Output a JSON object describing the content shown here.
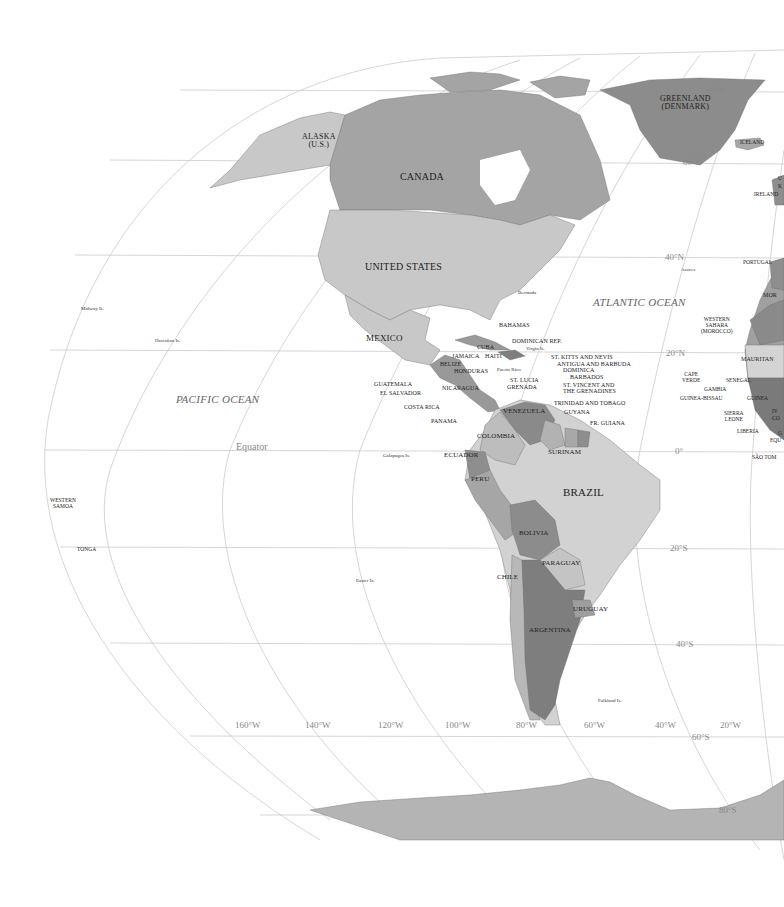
{
  "map": {
    "colors": {
      "background": "#ffffff",
      "graticule": "#bdbdbd",
      "land_light": "#d6d6d6",
      "land_mid": "#b8b8b8",
      "land_dark": "#8f8f8f",
      "land_darker": "#7a7a7a",
      "label": "#222222",
      "grid_label": "#888888"
    },
    "oceans": {
      "pacific": "PACIFIC OCEAN",
      "atlantic": "ATLANTIC OCEAN"
    },
    "latitude_labels": {
      "n80": "80°N",
      "n60": "60°N",
      "n40": "40°N",
      "n20": "20°N",
      "equator_left": "Equator",
      "equator_right": "0°",
      "s20": "20°S",
      "s40": "40°S",
      "s60": "60°S",
      "s80": "80°S"
    },
    "longitude_labels": [
      "160°W",
      "140°W",
      "120°W",
      "100°W",
      "80°W",
      "60°W",
      "40°W",
      "20°W"
    ],
    "countries": {
      "greenland": "GREENLAND",
      "greenland_sub": "(DENMARK)",
      "alaska": "ALASKA",
      "alaska_sub": "(U.S.)",
      "canada": "CANADA",
      "united_states": "UNITED STATES",
      "mexico": "MEXICO",
      "iceland": "ICELAND",
      "ireland": "IRELAND",
      "uk_partial_1": "U",
      "uk_partial_2": "K",
      "portugal": "PORTUGAL",
      "morocco_partial": "MOR",
      "western_sahara_1": "WESTERN",
      "western_sahara_2": "SAHARA",
      "western_sahara_3": "(MOROCCO)",
      "mauritania_partial": "MAURITAN",
      "cape_verde_1": "CAPE",
      "cape_verde_2": "VERDE",
      "senegal": "SENEGAL",
      "gambia": "GAMBIA",
      "guinea_bissau": "GUINEA-BISSAU",
      "guinea": "GUINEA",
      "sierra_leone_1": "SIERRA",
      "sierra_leone_2": "LEONE",
      "liberia": "LIBERIA",
      "ivory_partial_1": "IV",
      "ivory_partial_2": "CO",
      "eq_partial_1": "G",
      "eq_partial_2": "EQU",
      "sao_tome": "SÃO TOM",
      "bahamas": "BAHAMAS",
      "cuba": "CUBA",
      "jamaica": "JAMAICA",
      "haiti": "HAITI",
      "dominican_rep": "DOMINICAN REP.",
      "belize": "BELIZE",
      "honduras": "HONDURAS",
      "guatemala": "GUATEMALA",
      "el_salvador": "EL SALVADOR",
      "nicaragua": "NICARAGUA",
      "costa_rica": "COSTA RICA",
      "panama": "PANAMA",
      "st_kitts": "ST. KITTS AND NEVIS",
      "antigua": "ANTIGUA AND BARBUDA",
      "dominica": "DOMINICA",
      "barbados": "BARBADOS",
      "st_lucia": "ST. LUCIA",
      "grenada": "GRENADA",
      "st_vincent_1": "ST. VINCENT AND",
      "st_vincent_2": "THE GRENADINES",
      "trinidad": "TRINIDAD AND TOBAGO",
      "guyana": "GUYANA",
      "fr_guiana": "FR. GUIANA",
      "venezuela": "VENEZUELA",
      "colombia": "COLOMBIA",
      "suriname": "SURINAM",
      "ecuador": "ECUADOR",
      "peru": "PERU",
      "brazil": "BRAZIL",
      "bolivia": "BOLIVIA",
      "paraguay": "PARAGUAY",
      "chile": "CHILE",
      "uruguay": "URUGUAY",
      "argentina": "ARGENTINA",
      "western_samoa_1": "WESTERN",
      "western_samoa_2": "SAMOA",
      "tonga": "TONGA"
    },
    "islands": {
      "bermuda": "Bermuda",
      "azores": "Azores",
      "midway": "Midway Is.",
      "hawaiian": "Hawaiian Is.",
      "virgin": "Virgin Is.",
      "puerto_rico": "Puerto Rico",
      "galapagos": "Galapagos Is.",
      "easter": "Easter Is.",
      "falkland": "Falkland Is."
    }
  }
}
